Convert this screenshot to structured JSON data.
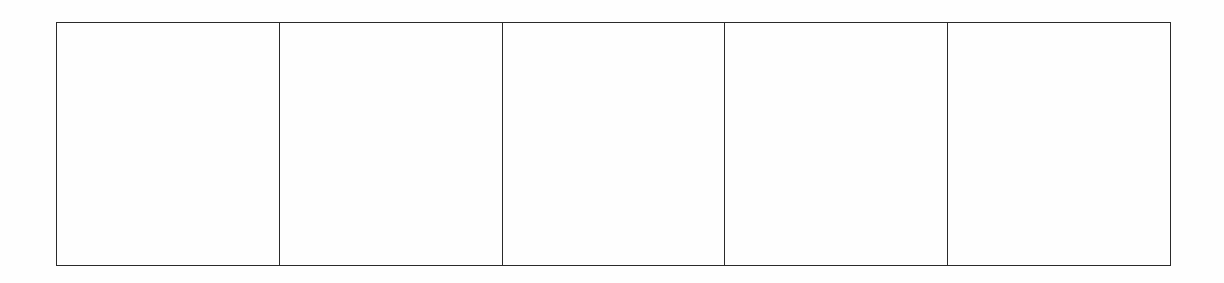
{
  "document": {
    "layout": "single row of empty boxes",
    "box_count": 5,
    "boxes": [
      {
        "content": ""
      },
      {
        "content": ""
      },
      {
        "content": ""
      },
      {
        "content": ""
      },
      {
        "content": ""
      }
    ],
    "colors": {
      "background": "#fefefe",
      "border": "#2a2a2a"
    }
  }
}
